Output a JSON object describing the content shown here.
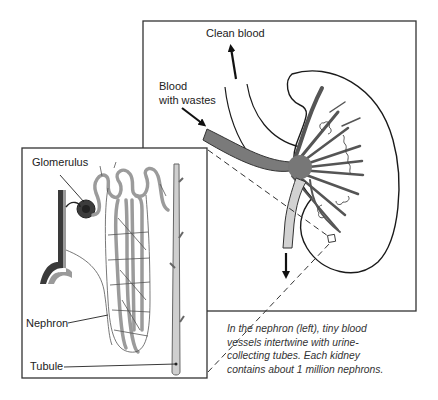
{
  "figure": {
    "kidney_panel": {
      "labels": {
        "clean_blood": "Clean blood",
        "blood_with_wastes_line1": "Blood",
        "blood_with_wastes_line2": "with wastes"
      }
    },
    "nephron_panel": {
      "labels": {
        "glomerulus": "Glomerulus",
        "nephron": "Nephron",
        "tubule": "Tubule"
      }
    },
    "caption": {
      "lines": [
        "In the nephron (left), tiny blood",
        "vessels intertwine with urine-",
        "collecting tubes. Each kidney",
        "contains about 1 million nephrons."
      ]
    },
    "colors": {
      "outline": "#2a2a2a",
      "vessel_dark": "#6e6e6e",
      "vessel_light": "#c9c9c9",
      "tubule_fill": "#cfcfcf",
      "glomerulus": "#3a3a3a",
      "background": "#ffffff"
    }
  }
}
